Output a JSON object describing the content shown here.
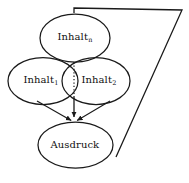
{
  "diagram": {
    "background_color": "#ffffff",
    "stroke_color": "#1a1a1a",
    "width": 189,
    "height": 183,
    "nodes": [
      {
        "id": "inhalt-n",
        "base_label": "Inhalt",
        "subscript": "n",
        "shape": "ellipse",
        "cx": 75,
        "cy": 38,
        "rx": 35,
        "ry": 24,
        "label_x": 75,
        "label_y": 37
      },
      {
        "id": "inhalt-1",
        "base_label": "Inhalt",
        "subscript": "1",
        "shape": "ellipse",
        "cx": 43,
        "cy": 81,
        "rx": 35,
        "ry": 23.5,
        "label_x": 41,
        "label_y": 80
      },
      {
        "id": "inhalt-2",
        "base_label": "Inhalt",
        "subscript": "2",
        "shape": "ellipse",
        "cx": 96,
        "cy": 81,
        "rx": 34,
        "ry": 23.5,
        "label_x": 99,
        "label_y": 80
      },
      {
        "id": "ausdruck",
        "base_label": "Ausdruck",
        "subscript": "",
        "shape": "ellipse",
        "cx": 75.5,
        "cy": 145,
        "rx": 37.5,
        "ry": 23,
        "label_x": 75,
        "label_y": 145
      }
    ],
    "connectors": [
      {
        "id": "dotted-separator",
        "style": "dotted",
        "from_x": 74,
        "from_y": 62,
        "to_x": 74,
        "to_y": 97
      },
      {
        "id": "arrow-center-to-ausdruck",
        "style": "solid-arrow",
        "from_x": 74,
        "from_y": 97,
        "to_x": 74,
        "to_y": 122
      },
      {
        "id": "arrow-left-to-ausdruck",
        "style": "solid-arrow",
        "from_x": 37,
        "from_y": 101,
        "to_x": 74,
        "to_y": 122
      },
      {
        "id": "arrow-right-to-ausdruck",
        "style": "solid-arrow",
        "from_x": 110,
        "from_y": 101,
        "to_x": 74,
        "to_y": 122
      }
    ],
    "bracket": {
      "id": "scope-bracket",
      "style": "solid-open-polyline",
      "points": "74,13 74,8 182,10 116,157"
    }
  }
}
